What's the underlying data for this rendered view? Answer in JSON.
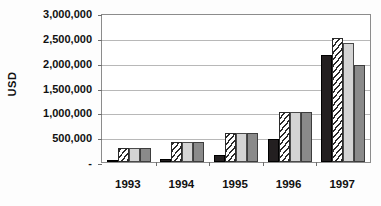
{
  "chart_data": {
    "type": "bar",
    "title": "",
    "xlabel": "",
    "ylabel": "USD",
    "ylim": [
      0,
      3000000
    ],
    "ytick_values": [
      3000000,
      2500000,
      2000000,
      1500000,
      1000000,
      500000,
      0
    ],
    "ytick_labels": [
      "3,000,000",
      "2,500,000",
      "2,000,000",
      "1,500,000",
      "1,000,000",
      "500,000",
      "-"
    ],
    "grid": true,
    "legend": "none",
    "categories": [
      "1993",
      "1994",
      "1995",
      "1996",
      "1997"
    ],
    "series": [
      {
        "name": "Series 1",
        "pattern": "solid-black",
        "color": "#231f20",
        "values": [
          30000,
          60000,
          140000,
          460000,
          2150000
        ]
      },
      {
        "name": "Series 2",
        "pattern": "diagonal-hatch",
        "color": "#ffffff",
        "values": [
          290000,
          400000,
          580000,
          1000000,
          2500000
        ]
      },
      {
        "name": "Series 3",
        "pattern": "light-dotted",
        "color": "#d4d4d4",
        "values": [
          290000,
          400000,
          580000,
          1000000,
          2400000
        ]
      },
      {
        "name": "Series 4",
        "pattern": "solid-gray",
        "color": "#8a8a8a",
        "values": [
          290000,
          400000,
          580000,
          1000000,
          1950000
        ]
      }
    ]
  }
}
